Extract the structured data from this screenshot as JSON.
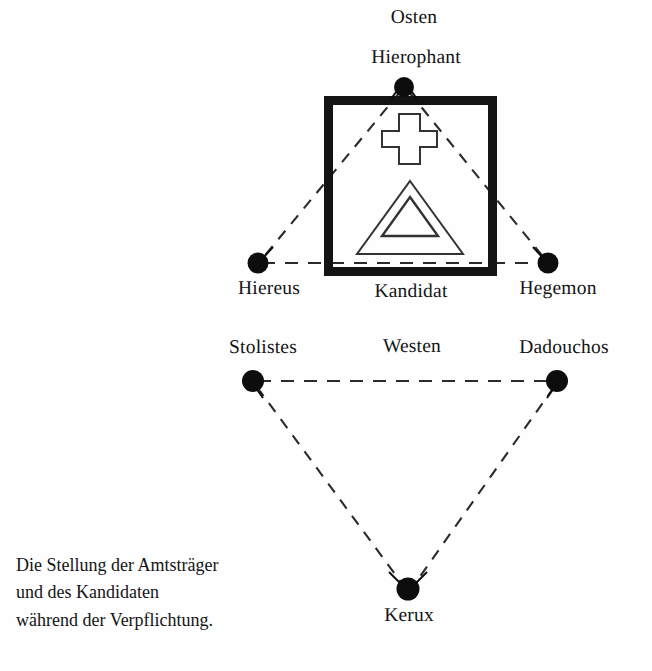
{
  "figure": {
    "title_caption": [
      "Die Stellung der Amtsträger",
      "und des Kandidaten",
      "während der Verpflichtung."
    ],
    "orientation_labels": {
      "east": "Osten",
      "west": "Westen"
    },
    "center_label": "Kandidat",
    "nodes": [
      {
        "id": "hierophant",
        "label": "Hierophant",
        "x": 404,
        "y": 87,
        "label_x": 414,
        "label_y": 48,
        "label_anchor": "above"
      },
      {
        "id": "hiereus",
        "label": "Hiereus",
        "x": 258,
        "y": 263,
        "label_x": 269,
        "label_y": 279,
        "label_anchor": "below"
      },
      {
        "id": "hegemon",
        "label": "Hegemon",
        "x": 548,
        "y": 263,
        "label_x": 557,
        "label_y": 279,
        "label_anchor": "below"
      },
      {
        "id": "stolistes",
        "label": "Stolistes",
        "x": 253,
        "y": 381,
        "label_x": 263,
        "label_y": 338,
        "label_anchor": "above"
      },
      {
        "id": "dadouchos",
        "label": "Dadouchos",
        "x": 557,
        "y": 381,
        "label_x": 564,
        "label_y": 338,
        "label_anchor": "above"
      },
      {
        "id": "kerux",
        "label": "Kerux",
        "x": 408,
        "y": 589,
        "label_x": 409,
        "label_y": 605,
        "label_anchor": "below"
      }
    ],
    "label_positions": {
      "osten_x": 414,
      "osten_y": 8,
      "westen_x": 412,
      "westen_y": 337,
      "kandidat_x": 411,
      "kandidat_y": 281
    },
    "box": {
      "x": 324,
      "y": 96,
      "width": 173,
      "height": 180,
      "stroke_width": 9
    },
    "colors": {
      "ink": "#141414",
      "paper": "#fefefe",
      "dash": "#2b2b2b",
      "outline": "#333333"
    },
    "shapes": {
      "cross": "greek-cross-outline",
      "triangle_outer": "triangle-outline",
      "triangle_inner": "triangle-outline"
    },
    "edges": [
      {
        "from": "hierophant",
        "to": "hiereus",
        "style": "dashed"
      },
      {
        "from": "hierophant",
        "to": "hegemon",
        "style": "dashed"
      },
      {
        "from": "hiereus",
        "to": "hegemon",
        "style": "dashed"
      },
      {
        "from": "stolistes",
        "to": "dadouchos",
        "style": "dashed"
      },
      {
        "from": "stolistes",
        "to": "kerux",
        "style": "dashed"
      },
      {
        "from": "dadouchos",
        "to": "kerux",
        "style": "dashed"
      }
    ]
  }
}
